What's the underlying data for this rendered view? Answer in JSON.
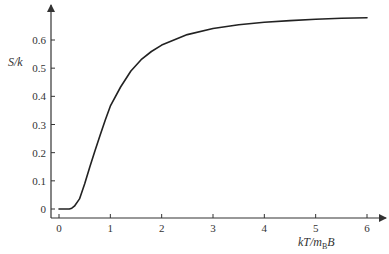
{
  "chart_data": {
    "type": "line",
    "title": "",
    "xlabel": "kT/mBB",
    "xlabel_parts": {
      "pre": "kT/m",
      "sub": "B",
      "post": "B"
    },
    "ylabel": "S/k",
    "xlim": [
      0,
      6
    ],
    "ylim": [
      0,
      0.7
    ],
    "x_ticks": [
      0,
      1,
      2,
      3,
      4,
      5,
      6
    ],
    "x_tick_labels": [
      "0",
      "1",
      "2",
      "3",
      "4",
      "5",
      "6"
    ],
    "y_ticks": [
      0,
      0.1,
      0.2,
      0.3,
      0.4,
      0.5,
      0.6
    ],
    "y_tick_labels": [
      "0",
      "0.1",
      "0.2",
      "0.3",
      "0.4",
      "0.5",
      "0.6"
    ],
    "grid": false,
    "legend": null,
    "series": [
      {
        "name": "S/k",
        "x": [
          0,
          0.1,
          0.2,
          0.25,
          0.3,
          0.4,
          0.5,
          0.6,
          0.7,
          0.8,
          0.9,
          1.0,
          1.2,
          1.4,
          1.6,
          1.8,
          2.0,
          2.5,
          3.0,
          3.5,
          4.0,
          4.5,
          5.0,
          5.5,
          6.0
        ],
        "y": [
          0,
          0,
          0.0,
          0.003,
          0.01,
          0.036,
          0.09,
          0.149,
          0.206,
          0.262,
          0.315,
          0.365,
          0.433,
          0.49,
          0.53,
          0.559,
          0.582,
          0.619,
          0.641,
          0.654,
          0.663,
          0.669,
          0.674,
          0.677,
          0.679
        ]
      }
    ]
  },
  "colors": {
    "axis": "#333333",
    "curve": "#222222",
    "background": "#ffffff"
  }
}
